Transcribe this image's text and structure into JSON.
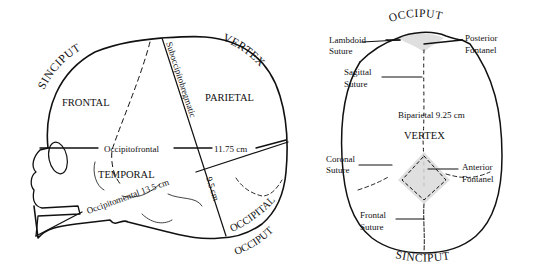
{
  "colors": {
    "ink": "#111111",
    "fontanel_shade": "#d9d9d9",
    "background": "#ffffff"
  },
  "lateral_view": {
    "regions": {
      "sinciput": "SINCIPUT",
      "vertex": "VERTEX",
      "frontal": "FRONTAL",
      "parietal": "PARIETAL",
      "temporal": "TEMPORAL",
      "occipital": "OCCIPITAL",
      "occiput": "OCCIPUT"
    },
    "measurements": {
      "suboccipitobregmatic": "Suboccipitobregmatic",
      "occipitofrontal_label": "Occipitofrontal",
      "occipitofrontal_value": "11.75 cm",
      "occipitomental": "Occipitomental 13.5 cm",
      "suboccipitobregmatic_value": "9.5 cm"
    }
  },
  "superior_view": {
    "regions": {
      "occiput": "OCCIPUT",
      "vertex": "VERTEX",
      "sinciput": "SINCIPUT"
    },
    "labels": {
      "lambdoid_suture_1": "Lambdoid",
      "lambdoid_suture_2": "Suture",
      "posterior_fontanel_1": "Posterior",
      "posterior_fontanel_2": "Fontanel",
      "sagittal_suture_1": "Sagittal",
      "sagittal_suture_2": "Suture",
      "biparietal": "Biparietal 9.25 cm",
      "coronal_suture_1": "Coronal",
      "coronal_suture_2": "Suture",
      "anterior_fontanel_1": "Anterior",
      "anterior_fontanel_2": "Fontanel",
      "frontal_suture_1": "Frontal",
      "frontal_suture_2": "Suture"
    }
  }
}
